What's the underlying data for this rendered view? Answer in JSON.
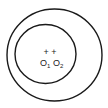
{
  "diagram": {
    "outer_circle": {
      "cx": 54.5,
      "cy": 55,
      "rx": 47.5,
      "ry": 46,
      "stroke": "#1a1a1a"
    },
    "inner_circle": {
      "cx": 45.5,
      "cy": 54,
      "rx": 30.5,
      "ry": 29.5,
      "stroke": "#1a1a1a"
    },
    "center_markers": "+ +",
    "labels": {
      "o1": "O",
      "o1_sub": "1",
      "o2": "O",
      "o2_sub": "2"
    }
  }
}
